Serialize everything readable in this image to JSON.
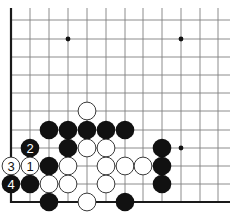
{
  "diagram": {
    "type": "go-board-fragment",
    "corner": "bottom-left",
    "colors": {
      "background": "#ffffff",
      "line": "#808080",
      "edge": "#1a1a1a",
      "black": "#111111",
      "white": "#ffffff",
      "stone_outline": "#222222"
    },
    "grid": {
      "columns_x": [
        11,
        30,
        49,
        68,
        87,
        106,
        125,
        143,
        162,
        181,
        200,
        218
      ],
      "rows_y": [
        20,
        39,
        57,
        75,
        93,
        111,
        130,
        148,
        166,
        184,
        202
      ],
      "line_top": 8,
      "line_right": 230,
      "stone_radius": 9.3
    },
    "star_points": [
      {
        "col": 3,
        "row": 1
      },
      {
        "col": 9,
        "row": 1
      },
      {
        "col": 9,
        "row": 7
      }
    ],
    "stones": [
      {
        "color": "white",
        "col": 4,
        "row": 5,
        "label": ""
      },
      {
        "color": "black",
        "col": 2,
        "row": 6,
        "label": ""
      },
      {
        "color": "black",
        "col": 3,
        "row": 6,
        "label": ""
      },
      {
        "color": "black",
        "col": 4,
        "row": 6,
        "label": ""
      },
      {
        "color": "black",
        "col": 5,
        "row": 6,
        "label": ""
      },
      {
        "color": "black",
        "col": 6,
        "row": 6,
        "label": ""
      },
      {
        "color": "black",
        "col": 1,
        "row": 7,
        "label": "2"
      },
      {
        "color": "black",
        "col": 3,
        "row": 7,
        "label": ""
      },
      {
        "color": "white",
        "col": 4,
        "row": 7,
        "label": ""
      },
      {
        "color": "white",
        "col": 5,
        "row": 7,
        "label": ""
      },
      {
        "color": "black",
        "col": 8,
        "row": 7,
        "label": ""
      },
      {
        "color": "white",
        "col": 0,
        "row": 8,
        "label": "3"
      },
      {
        "color": "white",
        "col": 1,
        "row": 8,
        "label": "1"
      },
      {
        "color": "black",
        "col": 2,
        "row": 8,
        "label": ""
      },
      {
        "color": "white",
        "col": 3,
        "row": 8,
        "label": ""
      },
      {
        "color": "white",
        "col": 5,
        "row": 8,
        "label": ""
      },
      {
        "color": "white",
        "col": 6,
        "row": 8,
        "label": ""
      },
      {
        "color": "white",
        "col": 7,
        "row": 8,
        "label": ""
      },
      {
        "color": "black",
        "col": 8,
        "row": 8,
        "label": ""
      },
      {
        "color": "black",
        "col": 0,
        "row": 9,
        "label": "4"
      },
      {
        "color": "black",
        "col": 1,
        "row": 9,
        "label": ""
      },
      {
        "color": "white",
        "col": 2,
        "row": 9,
        "label": ""
      },
      {
        "color": "white",
        "col": 3,
        "row": 9,
        "label": ""
      },
      {
        "color": "white",
        "col": 5,
        "row": 9,
        "label": ""
      },
      {
        "color": "black",
        "col": 8,
        "row": 9,
        "label": ""
      },
      {
        "color": "black",
        "col": 2,
        "row": 10,
        "label": ""
      },
      {
        "color": "white",
        "col": 4,
        "row": 10,
        "label": ""
      },
      {
        "color": "black",
        "col": 6,
        "row": 10,
        "label": ""
      }
    ]
  }
}
